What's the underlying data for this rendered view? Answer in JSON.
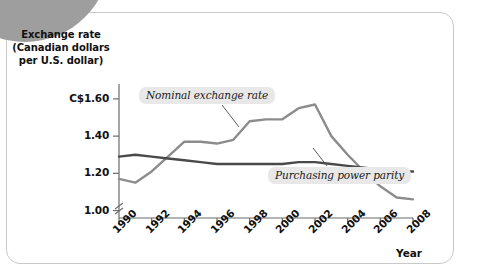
{
  "figure": {
    "y_axis_title": "Exchange rate (Canadian dollars per U.S. dollar)",
    "y_axis_title_lines": [
      "Exchange rate",
      "(Canadian dollars",
      "per U.S. dollar)"
    ],
    "x_axis_title": "Year"
  },
  "chart_data": {
    "type": "line",
    "title": "",
    "xlabel": "Year",
    "ylabel": "Exchange rate (Canadian dollars per U.S. dollar)",
    "xlim": [
      1990,
      2008
    ],
    "ylim": [
      0.96,
      1.68
    ],
    "y_axis_break": true,
    "grid": false,
    "legend": "inline-annotations",
    "ytick_labels": [
      "C$1.60",
      "1.40",
      "1.20",
      "1.00"
    ],
    "ytick_values": [
      1.6,
      1.4,
      1.2,
      1.0
    ],
    "xtick_labels": [
      "1990",
      "1992",
      "1994",
      "1996",
      "1998",
      "2000",
      "2002",
      "2004",
      "2006",
      "2008"
    ],
    "xtick_values": [
      1990,
      1992,
      1994,
      1996,
      1998,
      2000,
      2002,
      2004,
      2006,
      2008
    ],
    "x": [
      1990,
      1991,
      1992,
      1993,
      1994,
      1995,
      1996,
      1997,
      1998,
      1999,
      2000,
      2001,
      2002,
      2003,
      2004,
      2005,
      2006,
      2007,
      2008
    ],
    "series": [
      {
        "name": "Nominal exchange rate",
        "color": "#8c8c8c",
        "values": [
          1.17,
          1.15,
          1.21,
          1.29,
          1.37,
          1.37,
          1.36,
          1.38,
          1.48,
          1.49,
          1.49,
          1.55,
          1.57,
          1.4,
          1.3,
          1.21,
          1.13,
          1.07,
          1.06
        ]
      },
      {
        "name": "Purchasing power parity",
        "color": "#4a4a4a",
        "values": [
          1.29,
          1.3,
          1.29,
          1.28,
          1.27,
          1.26,
          1.25,
          1.25,
          1.25,
          1.25,
          1.25,
          1.26,
          1.26,
          1.25,
          1.24,
          1.23,
          1.22,
          1.21,
          1.21
        ]
      }
    ],
    "annotations": [
      {
        "text": "Nominal exchange rate",
        "points_to_year": 2000
      },
      {
        "text": "Purchasing power parity",
        "points_to_year": 2003
      }
    ]
  }
}
